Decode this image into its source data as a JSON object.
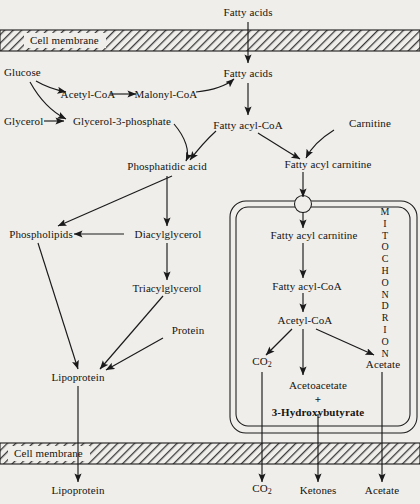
{
  "diagram": {
    "background_color": "#efeeeb",
    "line_color": "#1a1a1a",
    "membrane_label_top": "Cell membrane",
    "membrane_label_bottom": "Cell membrane",
    "organelle_label": "MITOCHONDRION"
  },
  "nodes": {
    "fatty_acids_extracellular": "Fatty acids",
    "fatty_acids_cytosol": "Fatty acids",
    "glucose": "Glucose",
    "acetyl_coa_cyto": "Acetyl-CoA",
    "malonyl_coa": "Malonyl-CoA",
    "glycerol": "Glycerol",
    "glycerol_3_phosphate": "Glycerol-3-phosphate",
    "fatty_acyl_coa_cyto": "Fatty acyl-CoA",
    "carnitine": "Carnitine",
    "phosphatidic_acid": "Phosphatidic acid",
    "fatty_acyl_carnitine_cyto": "Fatty acyl carnitine",
    "phospholipids": "Phospholipids",
    "diacylglycerol": "Diacylglycerol",
    "fatty_acyl_carnitine_mito": "Fatty acyl carnitine",
    "triacylglycerol": "Triacylglycerol",
    "fatty_acyl_coa_mito": "Fatty acyl-CoA",
    "protein": "Protein",
    "acetyl_coa_mito": "Acetyl-CoA",
    "lipoprotein_cell": "Lipoprotein",
    "co2_mito": "CO2",
    "acetate_mito": "Acetate",
    "acetoacetate": "Acetoacetate",
    "plus_sign": "+",
    "hydroxybutyrate": "3-Hydroxybutyrate",
    "lipoprotein_blood": "Lipoprotein",
    "co2_blood": "CO2",
    "ketones_blood": "Ketones",
    "acetate_blood": "Acetate"
  },
  "subscripts": {
    "co2_main": "CO",
    "co2_sub": "2"
  }
}
